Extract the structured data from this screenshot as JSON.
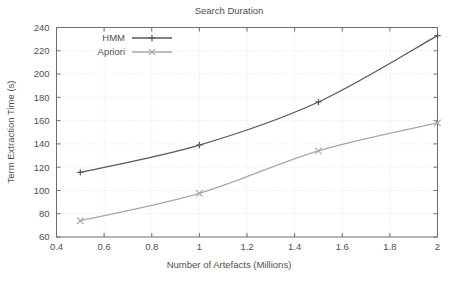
{
  "chart_data": {
    "type": "line",
    "title": "Search Duration",
    "xlabel": "Number of Artefacts (Millions)",
    "ylabel": "Term Extraction Time (s)",
    "xlim": [
      0.4,
      2.0
    ],
    "ylim": [
      60,
      240
    ],
    "xticks": [
      "0.4",
      "0.6",
      "0.8",
      "1",
      "1.2",
      "1.4",
      "1.6",
      "1.8",
      "2"
    ],
    "xtick_values": [
      0.4,
      0.6,
      0.8,
      1.0,
      1.2,
      1.4,
      1.6,
      1.8,
      2.0
    ],
    "yticks": [
      "60",
      "80",
      "100",
      "120",
      "140",
      "160",
      "180",
      "200",
      "220",
      "240"
    ],
    "ytick_values": [
      60,
      80,
      100,
      120,
      140,
      160,
      180,
      200,
      220,
      240
    ],
    "grid": true,
    "legend_position": "top-left-inside",
    "x": [
      0.5,
      1.0,
      1.5,
      2.0
    ],
    "series": [
      {
        "name": "HMM",
        "values": [
          115.5,
          139.0,
          176.0,
          233.0
        ],
        "color": "#5a5a5a",
        "marker": "plus"
      },
      {
        "name": "Apriori",
        "values": [
          74.0,
          97.5,
          134.0,
          158.0
        ],
        "color": "#a8a8a8",
        "marker": "cross"
      }
    ]
  },
  "colors": {
    "background": "#ffffff",
    "axis": "#6d6d6d",
    "grid": "#d9d9d9",
    "text": "#4f4f4f",
    "hmm": "#5a5a5a",
    "apriori": "#a8a8a8"
  }
}
